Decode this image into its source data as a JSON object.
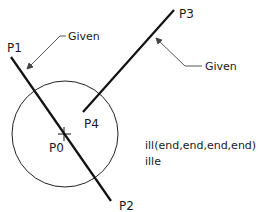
{
  "points": {
    "p0": "P0",
    "p1": "P1",
    "p2": "P2",
    "p3": "P3",
    "p4": "P4"
  },
  "annotations": {
    "given_left": "Given",
    "given_right": "Given"
  },
  "command": {
    "line1": "ill(end,end,end,end)",
    "line2": "ille"
  },
  "colors": {
    "stroke": "#111111",
    "leader": "#444444"
  }
}
